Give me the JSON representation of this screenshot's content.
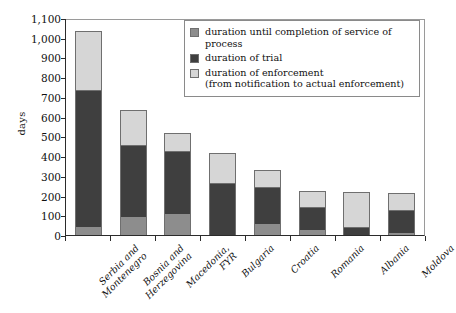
{
  "chart_data": {
    "type": "bar",
    "subtype": "stacked-bar",
    "title": "",
    "xlabel": "",
    "ylabel": "days",
    "ylim": [
      0,
      1100
    ],
    "ytick_step": 100,
    "ytick_labels": [
      "1,100",
      "1,000",
      "900",
      "800",
      "700",
      "600",
      "500",
      "400",
      "300",
      "200",
      "100",
      "0"
    ],
    "grid": false,
    "legend_position": "top-right",
    "categories": [
      "Serbia and\nMontenegro",
      "Bosnia and\nHerzegovina",
      "Macedonia,\nFYR",
      "Bulgaria",
      "Croatia",
      "Romania",
      "Albania",
      "Moldova"
    ],
    "series": [
      {
        "name": "duration until completion of service of process",
        "color": "#8d8d8d",
        "values": [
          40,
          90,
          105,
          0,
          55,
          25,
          0,
          10
        ]
      },
      {
        "name": "duration of trial",
        "color": "#3f3f3f",
        "values": [
          690,
          360,
          315,
          260,
          185,
          110,
          35,
          110
        ]
      },
      {
        "name": "duration of enforcement",
        "color": "#d6d6d6",
        "values": [
          300,
          180,
          90,
          150,
          85,
          85,
          180,
          87
        ]
      }
    ],
    "totals": [
      1030,
      630,
      510,
      410,
      325,
      220,
      215,
      207
    ]
  },
  "legend": {
    "items": [
      {
        "swatch": "service",
        "label": "duration until completion of service of process",
        "sub": ""
      },
      {
        "swatch": "trial",
        "label": "duration of trial",
        "sub": ""
      },
      {
        "swatch": "enforce",
        "label": "duration of enforcement",
        "sub": "(from notification to actual enforcement)"
      }
    ]
  }
}
